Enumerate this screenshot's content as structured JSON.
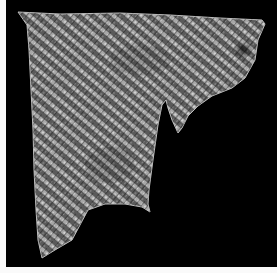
{
  "image": {
    "subject": "Woven textile fragment photographed on black background",
    "background_color": "#000000",
    "margin_color": "#fafafa",
    "fabric_color": "#9a9a9a",
    "stripe_dark_color": "#2a2a2a",
    "stripe_direction": "diagonal, top-left to bottom-right"
  }
}
